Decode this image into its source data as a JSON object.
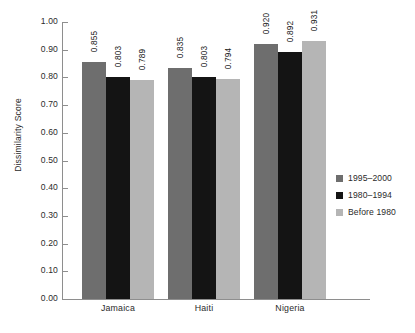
{
  "chart_data": {
    "type": "bar",
    "title": "",
    "xlabel": "",
    "ylabel": "Dissimilarity Score",
    "ylim": [
      0.0,
      1.0
    ],
    "ytick_step": 0.1,
    "grid": false,
    "legend_position": "right",
    "categories": [
      "Jamaica",
      "Haiti",
      "Nigeria"
    ],
    "ytick_labels": [
      "1.00",
      "0.90",
      "0.80",
      "0.70",
      "0.60",
      "0.50",
      "0.40",
      "0.30",
      "0.20",
      "0.10",
      "0.00"
    ],
    "series": [
      {
        "name": "1995–2000",
        "color": "#6e6e6e",
        "values": [
          0.855,
          0.835,
          0.92
        ],
        "labels": [
          "0.855",
          "0.835",
          "0.920"
        ]
      },
      {
        "name": "1980–1994",
        "color": "#141414",
        "values": [
          0.803,
          0.803,
          0.892
        ],
        "labels": [
          "0.803",
          "0.803",
          "0.892"
        ]
      },
      {
        "name": "Before 1980",
        "color": "#b5b5b5",
        "values": [
          0.789,
          0.794,
          0.931
        ],
        "labels": [
          "0.789",
          "0.794",
          "0.931"
        ]
      }
    ]
  }
}
